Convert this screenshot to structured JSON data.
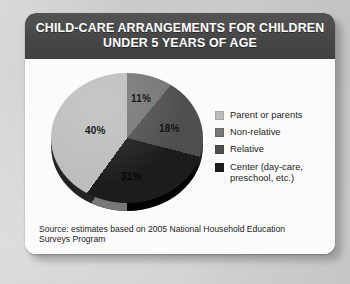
{
  "card": {
    "title": "CHILD-CARE ARRANGEMENTS FOR CHILDREN UNDER 5 YEARS OF AGE",
    "title_line1": "CHILD-CARE ARRANGEMENTS FOR CHILDREN",
    "title_line2": "UNDER 5 YEARS OF AGE",
    "source": "Source: estimates based on 2005 National Household Education Surveys Program",
    "header_bg": "#474747",
    "card_bg": "#fbfbfb",
    "page_bg": "#cfcfcf"
  },
  "legend": {
    "items": [
      {
        "label": "Parent or parents",
        "color": "#bdbdbd"
      },
      {
        "label": "Non-relative",
        "color": "#767676"
      },
      {
        "label": "Relative",
        "color": "#4f4f4f"
      },
      {
        "label": "Center (day-care, preschool, etc.)",
        "color": "#1c1c1c"
      }
    ]
  },
  "labels": {
    "parent": "40%",
    "non_relative": "11%",
    "relative": "18%",
    "center": "31%"
  },
  "chart_data": {
    "type": "pie",
    "title": "CHILD-CARE ARRANGEMENTS FOR CHILDREN UNDER 5 YEARS OF AGE",
    "categories": [
      "Parent or parents",
      "Non-relative",
      "Relative",
      "Center (day-care, preschool, etc.)"
    ],
    "values": [
      40,
      11,
      18,
      31
    ],
    "value_labels": [
      "40%",
      "11%",
      "18%",
      "31%"
    ],
    "colors": [
      "#bdbdbd",
      "#767676",
      "#4f4f4f",
      "#1c1c1c"
    ],
    "units": "percent",
    "total": 100,
    "start_angle_deg": 0,
    "direction": "clockwise",
    "slice_order_from_12_oclock": [
      "Non-relative",
      "Relative",
      "Center (day-care, preschool, etc.)",
      "Parent or parents"
    ],
    "legend_position": "right",
    "three_d": true,
    "grid": false,
    "xlabel": "",
    "ylabel": "",
    "annotations": [
      "Source: estimates based on 2005 National Household Education Surveys Program"
    ]
  }
}
